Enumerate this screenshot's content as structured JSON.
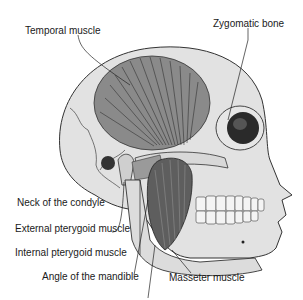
{
  "figure": {
    "labels": {
      "temporal_muscle": "Temporal muscle",
      "zygomatic_bone": "Zygomatic bone",
      "neck_of_condyle": "Neck of the condyle",
      "external_pterygoid": "External pterygoid muscle",
      "internal_pterygoid": "Internal pterygoid muscle",
      "angle_of_mandible": "Angle of the mandible",
      "masseter_muscle": "Masseter muscle"
    },
    "colors": {
      "bone": "#e2e2e2",
      "outline": "#333333",
      "muscle": "#8a8a8a",
      "muscle_dark": "#5a5a5a",
      "orbit": "#2a2a2a"
    }
  }
}
